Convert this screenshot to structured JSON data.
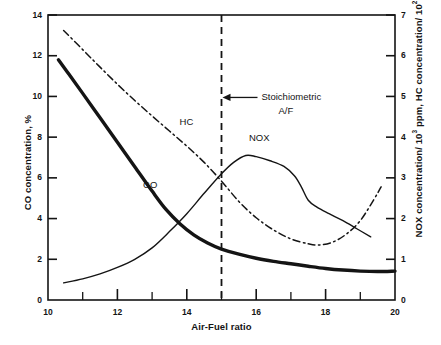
{
  "chart_data": {
    "type": "line",
    "title": "",
    "subtitle": "",
    "xlabel": "Air-Fuel ratio",
    "ylabel": "CO concentration, %",
    "ylabel_right": "NOX concentration/ 10³ ppm, HC concentration/ 10² ppm",
    "ylabel_right_parts": {
      "nox_prefix": "NOX concentration/ 10",
      "nox_exp": "3",
      "nox_suffix": " ppm, HC concentration/ 10",
      "hc_exp": "2",
      "hc_suffix": " ppm"
    },
    "xlim": [
      10,
      20
    ],
    "ylim": [
      0,
      14
    ],
    "ylim_right": [
      0,
      7
    ],
    "xticks": [
      10,
      12,
      14,
      16,
      18,
      20
    ],
    "xtick_labels": [
      "10",
      "12",
      "14",
      "16",
      "18",
      "20"
    ],
    "xminor_ticks": [
      11,
      13,
      15,
      17,
      19
    ],
    "yticks": [
      0,
      2,
      4,
      6,
      8,
      10,
      12,
      14
    ],
    "ytick_labels": [
      "0",
      "2",
      "4",
      "6",
      "8",
      "10",
      "12",
      "14"
    ],
    "yticks_right": [
      0,
      1,
      2,
      3,
      4,
      5,
      6,
      7
    ],
    "ytick_labels_right": [
      "0",
      "1",
      "2",
      "3",
      "4",
      "5",
      "6",
      "7"
    ],
    "grid": false,
    "legend": "inline-curve-labels",
    "series": [
      {
        "name": "CO",
        "axis": "left",
        "units": "%",
        "style": "solid-thick",
        "label_position": {
          "x": 13.0,
          "y": 5.6
        },
        "x": [
          10.3,
          10.6,
          11.0,
          11.5,
          12.0,
          12.5,
          13.0,
          13.4,
          13.8,
          14.2,
          14.6,
          15.0,
          15.5,
          16.0,
          16.5,
          17.0,
          17.5,
          18.0,
          18.5,
          19.0,
          19.5,
          20.0
        ],
        "y": [
          11.8,
          11.1,
          10.15,
          8.95,
          7.75,
          6.55,
          5.35,
          4.45,
          3.75,
          3.2,
          2.8,
          2.5,
          2.25,
          2.05,
          1.9,
          1.78,
          1.66,
          1.55,
          1.47,
          1.42,
          1.4,
          1.42
        ]
      },
      {
        "name": "HC",
        "axis": "right",
        "units": "10² ppm",
        "style": "dash-dot",
        "label_position": {
          "x": 14.05,
          "y": 4.35
        },
        "x": [
          10.45,
          11.0,
          11.5,
          12.0,
          12.5,
          13.0,
          13.5,
          14.0,
          14.5,
          15.0,
          15.5,
          16.0,
          16.5,
          17.0,
          17.5,
          17.8,
          18.2,
          18.6,
          19.0,
          19.4,
          19.6
        ],
        "y": [
          6.62,
          6.15,
          5.72,
          5.3,
          4.9,
          4.52,
          4.15,
          3.78,
          3.38,
          2.92,
          2.42,
          2.02,
          1.72,
          1.5,
          1.38,
          1.35,
          1.42,
          1.62,
          1.95,
          2.48,
          2.78
        ]
      },
      {
        "name": "NOX",
        "axis": "right",
        "units": "10³ ppm",
        "style": "solid-thin",
        "label_position": {
          "x": 16.05,
          "y": 3.95
        },
        "x": [
          10.45,
          11.0,
          11.5,
          12.0,
          12.5,
          13.0,
          13.5,
          14.0,
          14.5,
          15.0,
          15.35,
          15.7,
          16.0,
          16.4,
          16.8,
          17.1,
          17.3,
          17.5,
          17.75,
          18.1,
          18.5,
          18.9,
          19.3
        ],
        "y": [
          0.42,
          0.52,
          0.64,
          0.8,
          1.0,
          1.28,
          1.68,
          2.12,
          2.62,
          3.1,
          3.38,
          3.55,
          3.52,
          3.42,
          3.28,
          3.05,
          2.78,
          2.45,
          2.28,
          2.12,
          1.95,
          1.75,
          1.55
        ]
      }
    ],
    "annotations": [
      {
        "name": "stoichiometric-line",
        "type": "vline",
        "x": 15.0,
        "style": "dashed"
      },
      {
        "name": "stoichiometric-annotation",
        "type": "arrow-label",
        "line1": "Stoichiometric",
        "line2": "A/F",
        "arrow_points_to_x": 15.0,
        "arrow_direction": "left"
      }
    ],
    "colors": {
      "axis": "#141414",
      "curve": "#141414",
      "background": "#ffffff",
      "text": "#141414"
    }
  }
}
